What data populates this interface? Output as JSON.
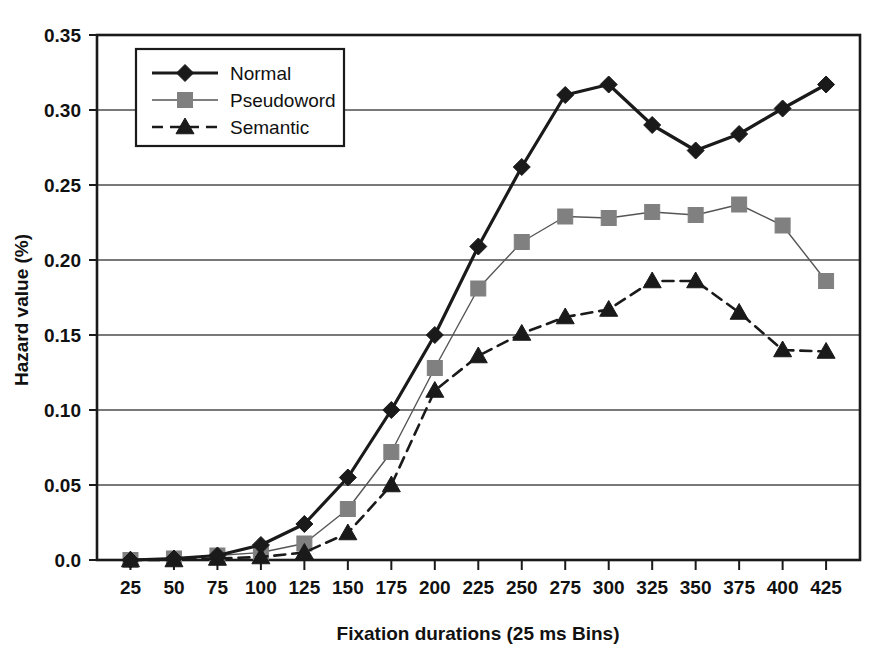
{
  "chart_data": {
    "type": "line",
    "title": "",
    "xlabel": "Fixation durations (25 ms Bins)",
    "ylabel": "Hazard value (%)",
    "categories": [
      25,
      50,
      75,
      100,
      125,
      150,
      175,
      200,
      225,
      250,
      275,
      300,
      325,
      350,
      375,
      400,
      425
    ],
    "x_tick_labels": [
      "25",
      "50",
      "75",
      "100",
      "125",
      "150",
      "175",
      "200",
      "225",
      "250",
      "275",
      "300",
      "325",
      "350",
      "375",
      "400",
      "425"
    ],
    "y_tick_labels": [
      "0.0",
      "0.05",
      "0.10",
      "0.15",
      "0.20",
      "0.25",
      "0.30",
      "0.35"
    ],
    "y_tick_values": [
      0.0,
      0.05,
      0.1,
      0.15,
      0.2,
      0.25,
      0.3,
      0.35
    ],
    "ylim": [
      0.0,
      0.35
    ],
    "grid": "horizontal",
    "legend_position": "top-left-inside",
    "series": [
      {
        "name": "Normal",
        "marker": "diamond",
        "color": "#1a1a1a",
        "line_style": "solid",
        "line_width": 3.2,
        "values": [
          0.0,
          0.001,
          0.003,
          0.01,
          0.024,
          0.055,
          0.1,
          0.15,
          0.209,
          0.262,
          0.31,
          0.317,
          0.29,
          0.273,
          0.284,
          0.301,
          0.317
        ]
      },
      {
        "name": "Pseudoword",
        "marker": "square",
        "color": "#808080",
        "line_color": "#555555",
        "line_style": "solid",
        "line_width": 1.4,
        "values": [
          0.0,
          0.001,
          0.003,
          0.005,
          0.011,
          0.034,
          0.072,
          0.128,
          0.181,
          0.212,
          0.229,
          0.228,
          0.232,
          0.23,
          0.237,
          0.223,
          0.186
        ]
      },
      {
        "name": "Semantic",
        "marker": "triangle",
        "color": "#1a1a1a",
        "line_style": "dashed",
        "line_width": 2.6,
        "values": [
          0.0,
          0.0,
          0.001,
          0.002,
          0.005,
          0.018,
          0.05,
          0.113,
          0.136,
          0.151,
          0.162,
          0.167,
          0.186,
          0.186,
          0.165,
          0.14,
          0.139
        ]
      }
    ]
  },
  "legend": {
    "entries": [
      {
        "label": "Normal"
      },
      {
        "label": "Pseudoword"
      },
      {
        "label": "Semantic"
      }
    ]
  }
}
